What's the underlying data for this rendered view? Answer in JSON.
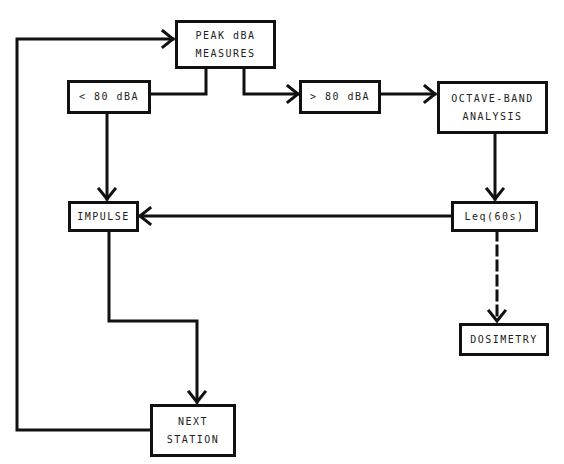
{
  "diagram": {
    "type": "flowchart",
    "nodes": [
      {
        "id": "peak",
        "lines": [
          "PEAK dBA",
          "MEASURES"
        ]
      },
      {
        "id": "lt80",
        "lines": [
          "< 80 dBA"
        ]
      },
      {
        "id": "gt80",
        "lines": [
          "> 80 dBA"
        ]
      },
      {
        "id": "octave",
        "lines": [
          "OCTAVE-BAND",
          "ANALYSIS"
        ]
      },
      {
        "id": "impulse",
        "lines": [
          "IMPULSE"
        ]
      },
      {
        "id": "leq",
        "lines": [
          "Leq(60s)"
        ]
      },
      {
        "id": "dosimetry",
        "lines": [
          "DOSIMETRY"
        ]
      },
      {
        "id": "next",
        "lines": [
          "NEXT",
          "STATION"
        ]
      }
    ],
    "edges": [
      {
        "from": "peak",
        "to": "lt80",
        "style": "solid",
        "arrow": false
      },
      {
        "from": "peak",
        "to": "gt80",
        "style": "solid",
        "arrow": true
      },
      {
        "from": "gt80",
        "to": "octave",
        "style": "solid",
        "arrow": true
      },
      {
        "from": "lt80",
        "to": "impulse",
        "style": "solid",
        "arrow": true
      },
      {
        "from": "octave",
        "to": "leq",
        "style": "solid",
        "arrow": true
      },
      {
        "from": "leq",
        "to": "impulse",
        "style": "solid",
        "arrow": true
      },
      {
        "from": "leq",
        "to": "dosimetry",
        "style": "dashed",
        "arrow": true
      },
      {
        "from": "impulse",
        "to": "next",
        "style": "solid",
        "arrow": true
      },
      {
        "from": "next",
        "to": "peak",
        "style": "solid",
        "arrow": true
      }
    ],
    "colors": {
      "line": "#111111",
      "text": "#222222",
      "background": "#ffffff"
    }
  }
}
